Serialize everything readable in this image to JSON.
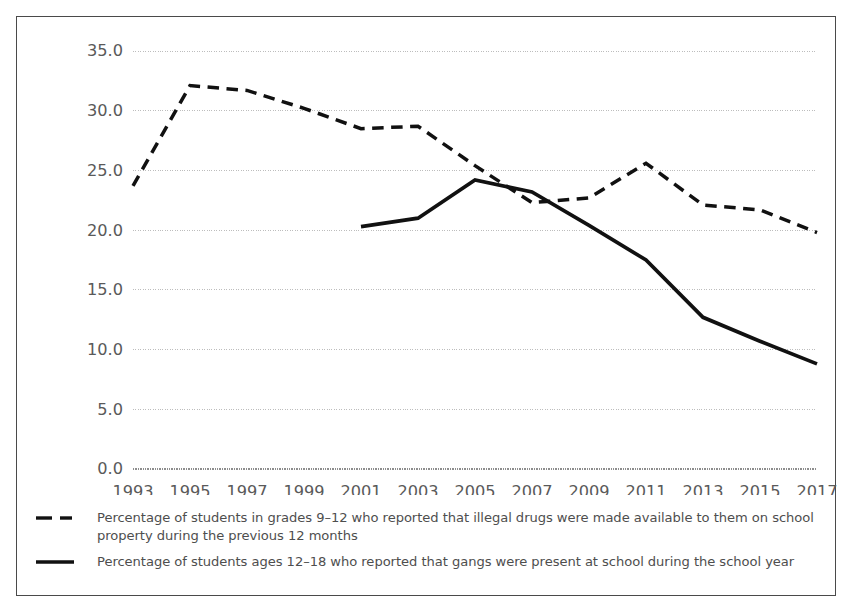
{
  "chart_data": {
    "type": "line",
    "title": "",
    "subtitle": "",
    "xlabel": "",
    "ylabel": "",
    "xlim": [
      1993,
      2017
    ],
    "ylim": [
      0.0,
      35.0
    ],
    "ytick_step": 5.0,
    "grid": "horizontal-dotted",
    "legend_position": "below",
    "categories": [
      "1993",
      "1995",
      "1997",
      "1999",
      "2001",
      "2003",
      "2005",
      "2007",
      "2009",
      "2011",
      "2013",
      "2015",
      "2017"
    ],
    "tick_labels_y": [
      "0.0",
      "5.0",
      "10.0",
      "15.0",
      "20.0",
      "25.0",
      "30.0",
      "35.0"
    ],
    "series": [
      {
        "name": "Percentage of students in grades 9–12 who reported that illegal drugs were made available to them on school property during the previous 12 months",
        "style": "dashed",
        "color": "#111111",
        "x": [
          1993,
          1995,
          1997,
          1999,
          2001,
          2003,
          2005,
          2007,
          2009,
          2011,
          2013,
          2015,
          2017
        ],
        "values": [
          23.7,
          32.1,
          31.7,
          30.2,
          28.5,
          28.7,
          25.4,
          22.3,
          22.7,
          25.6,
          22.1,
          21.7,
          19.8
        ]
      },
      {
        "name": "Percentage of students ages 12–18 who reported that gangs were present at school during the school year",
        "style": "solid",
        "color": "#111111",
        "x": [
          2001,
          2003,
          2005,
          2007,
          2009,
          2011,
          2013,
          2015,
          2017
        ],
        "values": [
          20.3,
          21.0,
          24.2,
          23.2,
          20.4,
          17.5,
          12.7,
          10.7,
          8.8
        ]
      }
    ]
  },
  "legend": {
    "entries": [
      {
        "key": "dashed-line-key",
        "label": "Percentage of students in grades 9–12 who reported that illegal drugs were made available to them on school property during the previous 12 months"
      },
      {
        "key": "solid-line-key",
        "label": "Percentage of students ages 12–18 who reported that gangs were present at school during the school year"
      }
    ]
  },
  "axes": {
    "y_tick_labels": [
      "35.0",
      "30.0",
      "25.0",
      "20.0",
      "15.0",
      "10.0",
      "5.0",
      "0.0"
    ],
    "x_tick_labels": [
      "1993",
      "1995",
      "1997",
      "1999",
      "2001",
      "2003",
      "2005",
      "2007",
      "2009",
      "2011",
      "2013",
      "2015",
      "2017"
    ],
    "tick_color": "#5a5a5a",
    "gridline_color": "#bdbdbd",
    "axis_line_color": "#555555"
  }
}
